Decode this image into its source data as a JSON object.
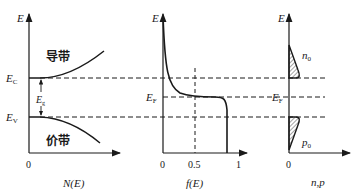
{
  "diagram": {
    "panels": [
      {
        "id": "density-of-states",
        "y_axis_label": "E",
        "x_axis_label": "N(E)",
        "origin_label": "0",
        "conduction_band_label": "导带",
        "valence_band_label": "价带",
        "ec_label": "E",
        "ec_sub": "C",
        "ev_label": "E",
        "ev_sub": "V",
        "eg_label": "E",
        "eg_sub": "g"
      },
      {
        "id": "fermi-distribution",
        "y_axis_label": "E",
        "x_axis_label": "f(E)",
        "ticks": [
          "0",
          "0.5",
          "1"
        ],
        "ef_label": "E",
        "ef_sub": "F"
      },
      {
        "id": "carrier-concentration",
        "y_axis_label": "E",
        "x_axis_label": "n,p",
        "origin_label": "0",
        "ef_label": "E",
        "ef_sub": "F",
        "electron_label": "n",
        "electron_sub": "0",
        "hole_label": "p",
        "hole_sub": "0"
      }
    ],
    "colors": {
      "line": "#1a1a1a",
      "background": "#ffffff"
    }
  }
}
